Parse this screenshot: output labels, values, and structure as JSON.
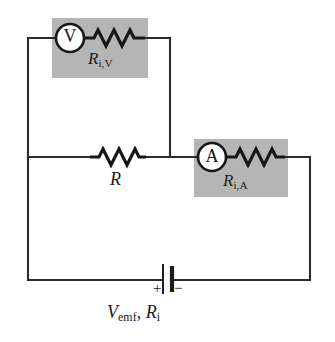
{
  "figure": {
    "type": "circuit-diagram",
    "background_color": "#ffffff",
    "wire_color": "#2b2b2b",
    "shade_color": "#b5b5b5"
  },
  "voltmeter": {
    "symbol": "V",
    "label_main": "R",
    "label_sub": "i,V",
    "shaded": true
  },
  "ammeter": {
    "symbol": "A",
    "label_main": "R",
    "label_sub": "i,A",
    "shaded": true
  },
  "resistor": {
    "label": "R"
  },
  "battery": {
    "label_main_1": "V",
    "label_sub_1": "emf",
    "separator": ", ",
    "label_main_2": "R",
    "label_sub_2": "i",
    "plus_sign": "+",
    "minus_sign": "−"
  }
}
